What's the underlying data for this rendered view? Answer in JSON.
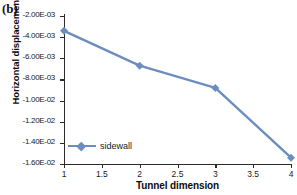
{
  "panel": {
    "label": "(b)"
  },
  "chart_data": {
    "type": "line",
    "title": "",
    "subtitle": "",
    "xlabel": "Tunnel dimension",
    "ylabel": "Horizontal displacement(m)",
    "x": [
      1,
      2,
      3,
      4
    ],
    "xlim": [
      1,
      4
    ],
    "ylim": [
      -0.016,
      -0.002
    ],
    "xticks": [
      1,
      1.5,
      2,
      2.5,
      3,
      3.5,
      4
    ],
    "xtick_labels": [
      "1",
      "1.5",
      "2",
      "2.5",
      "3",
      "3.5",
      "4"
    ],
    "yticks": [
      -0.002,
      -0.004,
      -0.006,
      -0.008,
      -0.01,
      -0.012,
      -0.014,
      -0.016
    ],
    "ytick_labels": [
      "-2.00E-03",
      "-4.00E-03",
      "-6.00E-03",
      "-8.00E-03",
      "-1.00E-02",
      "-1.20E-02",
      "-1.40E-02",
      "-1.60E-02"
    ],
    "grid": false,
    "legend_position": "bottom-left",
    "series": [
      {
        "name": "sidewall",
        "color": "#6c8ebf",
        "marker": "diamond",
        "values": [
          -0.0034,
          -0.0067,
          -0.0088,
          -0.0154
        ]
      }
    ]
  },
  "legend": {
    "entries": [
      "sidewall"
    ]
  },
  "colors": {
    "series": "#6c8ebf",
    "axis": "#2b2b2b",
    "text": "#1a1a1a"
  }
}
